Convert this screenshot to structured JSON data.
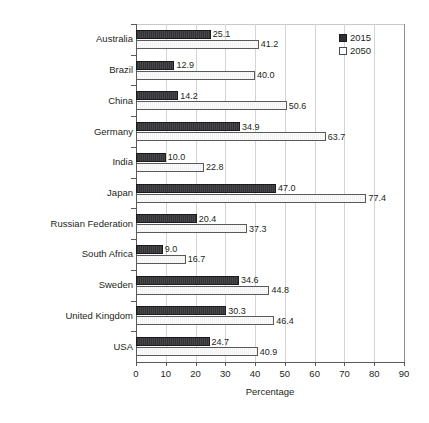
{
  "chart_data": {
    "type": "bar",
    "orientation": "horizontal",
    "title": "",
    "xlabel": "Percentage",
    "ylabel": "",
    "xlim": [
      0,
      90
    ],
    "xticks": [
      0,
      10,
      20,
      30,
      40,
      50,
      60,
      70,
      80,
      90
    ],
    "grid": true,
    "legend_position": "top-right",
    "categories": [
      "Australia",
      "Brazil",
      "China",
      "Germany",
      "India",
      "Japan",
      "Russian Federation",
      "South Africa",
      "Sweden",
      "United Kingdom",
      "USA"
    ],
    "series": [
      {
        "name": "2015",
        "color": "#333335",
        "style": "filled",
        "values": [
          25.1,
          12.9,
          14.2,
          34.9,
          10.0,
          47.0,
          20.4,
          9.0,
          34.6,
          30.3,
          24.7
        ],
        "labels": [
          "25.1",
          "12.9",
          "14.2",
          "34.9",
          "10.0",
          "47.0",
          "20.4",
          "9.0",
          "34.6",
          "30.3",
          "24.7"
        ]
      },
      {
        "name": "2050",
        "color": "#fbfbfb",
        "style": "open",
        "values": [
          41.2,
          40.0,
          50.6,
          63.7,
          22.8,
          77.4,
          37.3,
          16.7,
          44.8,
          46.4,
          40.9
        ],
        "labels": [
          "41.2",
          "40.0",
          "50.6",
          "63.7",
          "22.8",
          "77.4",
          "37.3",
          "16.7",
          "44.8",
          "46.4",
          "40.9"
        ]
      }
    ]
  },
  "legend": {
    "entries": [
      {
        "label": "2015",
        "swatch": "filled-square-icon"
      },
      {
        "label": "2050",
        "swatch": "open-square-icon"
      }
    ]
  },
  "axis": {
    "x_title": "Percentage"
  }
}
